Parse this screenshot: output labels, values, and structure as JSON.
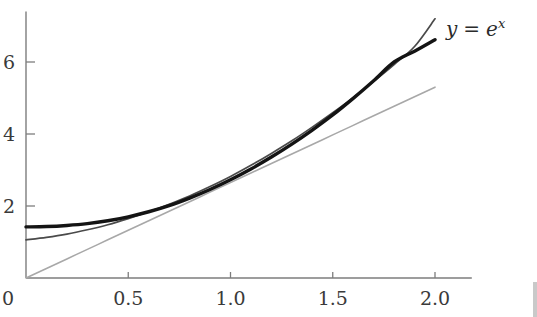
{
  "figure": {
    "name": "exponential-function-plot",
    "background": "#ffffff"
  },
  "annotations": {
    "curve_label": {
      "text": "y = e",
      "base": "y",
      "operator": "=",
      "function_base": "e",
      "exponent": "x",
      "full": "y = e^x",
      "x_value": 2.0,
      "y_value": 6.9
    }
  },
  "chart_data": {
    "type": "line",
    "title": "",
    "subtitle": "",
    "xlabel": "",
    "ylabel": "",
    "xlim": [
      0,
      2.18
    ],
    "ylim": [
      0,
      7.4
    ],
    "grid": false,
    "legend": "none",
    "x_ticks": [
      {
        "value": 0,
        "label": "0"
      },
      {
        "value": 0.5,
        "label": "0.5"
      },
      {
        "value": 1.0,
        "label": "1.0"
      },
      {
        "value": 1.5,
        "label": "1.5"
      },
      {
        "value": 2.0,
        "label": "2.0"
      }
    ],
    "y_ticks": [
      {
        "value": 0,
        "label": "0"
      },
      {
        "value": 2,
        "label": "2"
      },
      {
        "value": 4,
        "label": "4"
      },
      {
        "value": 6,
        "label": "6"
      }
    ],
    "x": [
      0,
      0.1,
      0.2,
      0.3,
      0.4,
      0.5,
      0.6,
      0.7,
      0.8,
      0.9,
      1.0,
      1.1,
      1.2,
      1.3,
      1.4,
      1.5,
      1.6,
      1.7,
      1.8,
      1.9,
      2.0
    ],
    "series": [
      {
        "name": "y = e^x",
        "style": "thick-black",
        "color": "#141414",
        "width": 3.4,
        "values": [
          1.42,
          1.43,
          1.46,
          1.51,
          1.59,
          1.7,
          1.84,
          2.01,
          2.22,
          2.46,
          2.73,
          3.03,
          3.36,
          3.72,
          4.11,
          4.53,
          4.99,
          5.48,
          6.0,
          6.3,
          6.62
        ]
      },
      {
        "name": "approximation-upper",
        "style": "thin-dark-gray",
        "color": "#4a4a4a",
        "width": 1.7,
        "values": [
          1.06,
          1.13,
          1.22,
          1.34,
          1.48,
          1.65,
          1.84,
          2.05,
          2.28,
          2.54,
          2.82,
          3.13,
          3.46,
          3.81,
          4.19,
          4.59,
          5.01,
          5.46,
          5.93,
          6.43,
          7.2
        ]
      },
      {
        "name": "tangent-line-through-origin",
        "style": "light-gray-straight",
        "color": "#a8a8a8",
        "width": 1.6,
        "values": [
          0,
          0.265,
          0.53,
          0.795,
          1.06,
          1.325,
          1.59,
          1.855,
          2.12,
          2.385,
          2.65,
          2.915,
          3.18,
          3.445,
          3.71,
          3.975,
          4.24,
          4.505,
          4.77,
          5.035,
          5.3
        ]
      }
    ]
  }
}
